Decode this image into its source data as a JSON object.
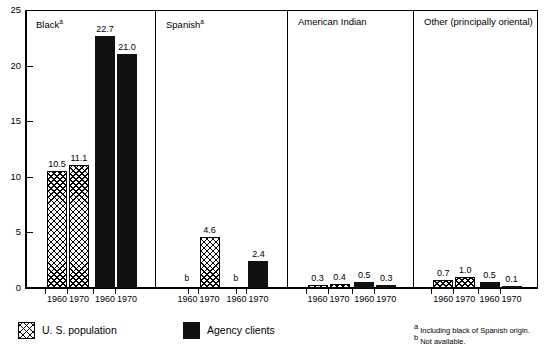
{
  "chart_data": {
    "type": "bar",
    "title": "",
    "xlabel": "",
    "ylabel": "",
    "ylim": [
      0,
      25
    ],
    "yticks": [
      0,
      5,
      10,
      15,
      20,
      25
    ],
    "ytick_labels": [
      "0",
      "5",
      "10",
      "15",
      "20",
      "25"
    ],
    "grid": false,
    "legend_position": "bottom-left",
    "categories": [
      "1960",
      "1970"
    ],
    "panels": [
      {
        "label": "Black",
        "footnote_marker": "a",
        "groups": [
          {
            "series": "U. S. population",
            "style": "hatch",
            "points": [
              {
                "x": "1960",
                "value": 10.5,
                "label": "10.5",
                "available": true
              },
              {
                "x": "1970",
                "value": 11.1,
                "label": "11.1",
                "available": true
              }
            ]
          },
          {
            "series": "Agency clients",
            "style": "solid",
            "points": [
              {
                "x": "1960",
                "value": 22.7,
                "label": "22.7",
                "available": true
              },
              {
                "x": "1970",
                "value": 21.0,
                "label": "21.0",
                "available": true
              }
            ]
          }
        ]
      },
      {
        "label": "Spanish",
        "footnote_marker": "a",
        "groups": [
          {
            "series": "U. S. population",
            "style": "hatch",
            "points": [
              {
                "x": "1960",
                "value": null,
                "label": "b",
                "available": false
              },
              {
                "x": "1970",
                "value": 4.6,
                "label": "4.6",
                "available": true
              }
            ]
          },
          {
            "series": "Agency clients",
            "style": "solid",
            "points": [
              {
                "x": "1960",
                "value": null,
                "label": "b",
                "available": false
              },
              {
                "x": "1970",
                "value": 2.4,
                "label": "2.4",
                "available": true
              }
            ]
          }
        ]
      },
      {
        "label": "American Indian",
        "footnote_marker": "",
        "groups": [
          {
            "series": "U. S. population",
            "style": "hatch",
            "points": [
              {
                "x": "1960",
                "value": 0.3,
                "label": "0.3",
                "available": true
              },
              {
                "x": "1970",
                "value": 0.4,
                "label": "0.4",
                "available": true
              }
            ]
          },
          {
            "series": "Agency clients",
            "style": "solid",
            "points": [
              {
                "x": "1960",
                "value": 0.5,
                "label": "0.5",
                "available": true
              },
              {
                "x": "1970",
                "value": 0.3,
                "label": "0.3",
                "available": true
              }
            ]
          }
        ]
      },
      {
        "label": "Other (principally oriental)",
        "footnote_marker": "",
        "groups": [
          {
            "series": "U. S. population",
            "style": "hatch",
            "points": [
              {
                "x": "1960",
                "value": 0.7,
                "label": "0.7",
                "available": true
              },
              {
                "x": "1970",
                "value": 1.0,
                "label": "1.0",
                "available": true
              }
            ]
          },
          {
            "series": "Agency clients",
            "style": "solid",
            "points": [
              {
                "x": "1960",
                "value": 0.5,
                "label": "0.5",
                "available": true
              },
              {
                "x": "1970",
                "value": 0.1,
                "label": "0.1",
                "available": true
              }
            ]
          }
        ]
      }
    ],
    "legend": [
      {
        "label": "U. S. population",
        "style": "hatch"
      },
      {
        "label": "Agency clients",
        "style": "solid"
      }
    ],
    "footnotes": [
      {
        "marker": "a",
        "text": "Including black of Spanish origin."
      },
      {
        "marker": "b",
        "text": "Not available."
      }
    ],
    "colors": {
      "solid": "#111111",
      "hatch_line": "#000000",
      "background": "#ffffff",
      "axis": "#000000"
    }
  }
}
